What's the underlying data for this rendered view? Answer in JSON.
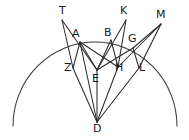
{
  "figure": {
    "background_color": "#ffffff",
    "stroke_color": "#2b2b2b",
    "label_color": "#1a1a1a",
    "width": 189,
    "height": 140,
    "points": [
      {
        "id": "T",
        "label": "T",
        "x": 62,
        "y": 20,
        "label_x": 59,
        "label_y": 5
      },
      {
        "id": "A",
        "label": "A",
        "x": 80,
        "y": 42,
        "label_x": 72,
        "label_y": 28
      },
      {
        "id": "B",
        "label": "B",
        "x": 111,
        "y": 40,
        "label_x": 104,
        "label_y": 27
      },
      {
        "id": "K",
        "label": "K",
        "x": 126,
        "y": 20,
        "label_x": 120,
        "label_y": 5
      },
      {
        "id": "M",
        "label": "M",
        "x": 161,
        "y": 24,
        "label_x": 156,
        "label_y": 9
      },
      {
        "id": "G",
        "label": "G",
        "x": 133,
        "y": 48,
        "label_x": 128,
        "label_y": 33
      },
      {
        "id": "Z",
        "label": "Z",
        "x": 73,
        "y": 68,
        "label_x": 64,
        "label_y": 62
      },
      {
        "id": "E",
        "label": "E",
        "x": 97,
        "y": 70,
        "label_x": 92,
        "label_y": 73
      },
      {
        "id": "H",
        "label": "H",
        "x": 118,
        "y": 67,
        "label_x": 115,
        "label_y": 62
      },
      {
        "id": "L",
        "label": "L",
        "x": 139,
        "y": 68,
        "label_x": 139,
        "label_y": 62
      },
      {
        "id": "D",
        "label": "D",
        "x": 97,
        "y": 122,
        "label_x": 93,
        "label_y": 123
      }
    ],
    "arc": {
      "description": "semicircular arc open downward",
      "start_x": 13,
      "start_y": 126,
      "end_x": 177,
      "end_y": 126,
      "radius_x": 82,
      "radius_y": 84
    },
    "segments": [
      {
        "from": "T",
        "to": "Z"
      },
      {
        "from": "T",
        "to": "E"
      },
      {
        "from": "A",
        "to": "Z"
      },
      {
        "from": "A",
        "to": "E"
      },
      {
        "from": "A",
        "to": "H"
      },
      {
        "from": "B",
        "to": "E"
      },
      {
        "from": "B",
        "to": "H"
      },
      {
        "from": "K",
        "to": "H"
      },
      {
        "from": "K",
        "to": "E"
      },
      {
        "from": "M",
        "to": "G"
      },
      {
        "from": "M",
        "to": "L"
      },
      {
        "from": "M",
        "to": "H"
      },
      {
        "from": "G",
        "to": "L"
      },
      {
        "from": "G",
        "to": "E"
      },
      {
        "from": "D",
        "to": "Z"
      },
      {
        "from": "D",
        "to": "E"
      },
      {
        "from": "D",
        "to": "H"
      },
      {
        "from": "D",
        "to": "L"
      },
      {
        "from": "D",
        "to": "A"
      }
    ]
  }
}
